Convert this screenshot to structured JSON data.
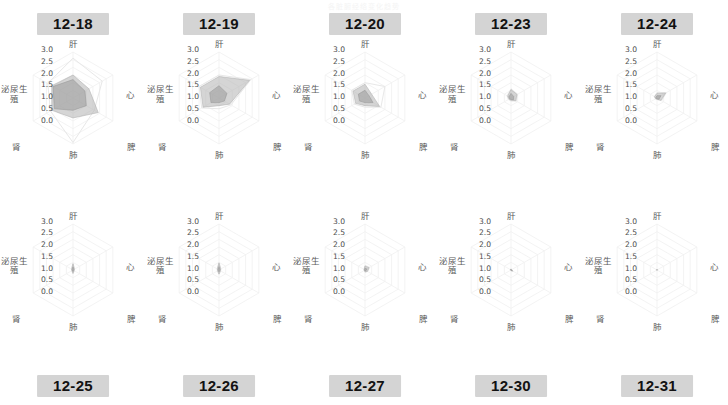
{
  "page": {
    "title": "各脏腑经络变化趋势"
  },
  "axes": {
    "labels": [
      "肝",
      "心",
      "脾",
      "肺",
      "肾",
      "泌尿生殖"
    ],
    "tick_labels": [
      "3.0",
      "2.5",
      "2.0",
      "1.5",
      "1.0",
      "0.5",
      "0.0"
    ],
    "radial_max": 3.0,
    "radial_min": 0.0
  },
  "colors": {
    "badge_bg": "#d4d4d4",
    "badge_text": "#121212",
    "grid_line": "#f0f0f0",
    "series_outline_fill": "none",
    "series_outline_stroke": "#e8e8e8",
    "series_fill_a": "#b3b3b3",
    "series_fill_b": "#9a9a9a",
    "axis_label_text": "#5a5a5a",
    "tick_text": "#4c4c4c",
    "page_bg": "#ffffff"
  },
  "chart_data": {
    "type": "radar",
    "title": "各脏腑经络变化趋势",
    "categories": [
      "肝",
      "心",
      "脾",
      "肺",
      "肾",
      "泌尿生殖"
    ],
    "rlim": [
      0.0,
      3.0
    ],
    "tick_values": [
      0.0,
      0.5,
      1.0,
      1.5,
      2.0,
      2.5,
      3.0
    ],
    "grid": true,
    "legend": "none",
    "panels": [
      {
        "label": "12-18",
        "row": "top",
        "series": [
          {
            "name": "外层",
            "values": [
              2.6,
              2.2,
              1.6,
              2.9,
              1.7,
              1.9
            ],
            "style": "outline"
          },
          {
            "name": "中层",
            "values": [
              1.5,
              1.2,
              1.9,
              1.3,
              1.6,
              1.6
            ],
            "style": "fill-a"
          },
          {
            "name": "内层",
            "values": [
              1.2,
              0.9,
              1.0,
              0.8,
              1.4,
              1.5
            ],
            "style": "fill-b"
          }
        ]
      },
      {
        "label": "12-19",
        "row": "top",
        "series": [
          {
            "name": "外层",
            "values": [
              1.5,
              2.4,
              0.9,
              0.7,
              1.3,
              1.5
            ],
            "style": "outline"
          },
          {
            "name": "中层",
            "values": [
              1.4,
              2.3,
              0.8,
              0.5,
              1.2,
              1.4
            ],
            "style": "fill-a"
          },
          {
            "name": "内层",
            "values": [
              0.8,
              0.6,
              0.4,
              0.3,
              0.6,
              0.7
            ],
            "style": "fill-b"
          }
        ]
      },
      {
        "label": "12-20",
        "row": "top",
        "series": [
          {
            "name": "外层",
            "values": [
              1.0,
              1.5,
              1.2,
              0.6,
              0.8,
              1.0
            ],
            "style": "outline"
          },
          {
            "name": "中层",
            "values": [
              0.9,
              0.5,
              1.1,
              0.5,
              0.7,
              0.9
            ],
            "style": "fill-a"
          },
          {
            "name": "内层",
            "values": [
              0.5,
              0.3,
              0.6,
              0.3,
              0.4,
              0.5
            ],
            "style": "fill-b"
          }
        ]
      },
      {
        "label": "12-23",
        "row": "top",
        "series": [
          {
            "name": "外层",
            "values": [
              0.6,
              0.5,
              0.4,
              0.2,
              0.2,
              0.3
            ],
            "style": "outline"
          },
          {
            "name": "中层",
            "values": [
              0.55,
              0.45,
              0.35,
              0.15,
              0.15,
              0.25
            ],
            "style": "fill-a"
          },
          {
            "name": "内层",
            "values": [
              0.3,
              0.2,
              0.2,
              0.1,
              0.1,
              0.15
            ],
            "style": "fill-b"
          }
        ]
      },
      {
        "label": "12-24",
        "row": "top",
        "series": [
          {
            "name": "外层",
            "values": [
              0.35,
              0.7,
              0.35,
              0.1,
              0.12,
              0.2
            ],
            "style": "outline"
          },
          {
            "name": "中层",
            "values": [
              0.3,
              0.65,
              0.3,
              0.08,
              0.1,
              0.18
            ],
            "style": "fill-a"
          },
          {
            "name": "内层",
            "values": [
              0.15,
              0.3,
              0.15,
              0.05,
              0.05,
              0.08
            ],
            "style": "fill-b"
          }
        ]
      },
      {
        "label": "12-25",
        "row": "bottom",
        "series": [
          {
            "name": "外层",
            "values": [
              0.45,
              0.12,
              0.1,
              0.25,
              0.1,
              0.12
            ],
            "style": "outline"
          },
          {
            "name": "中层",
            "values": [
              0.4,
              0.1,
              0.08,
              0.22,
              0.08,
              0.1
            ],
            "style": "fill-a"
          },
          {
            "name": "内层",
            "values": [
              0.2,
              0.05,
              0.04,
              0.1,
              0.04,
              0.05
            ],
            "style": "fill-b"
          }
        ]
      },
      {
        "label": "12-26",
        "row": "bottom",
        "series": [
          {
            "name": "外层",
            "values": [
              0.5,
              0.15,
              0.12,
              0.3,
              0.12,
              0.15
            ],
            "style": "outline"
          },
          {
            "name": "中层",
            "values": [
              0.45,
              0.12,
              0.1,
              0.26,
              0.1,
              0.12
            ],
            "style": "fill-a"
          },
          {
            "name": "内层",
            "values": [
              0.22,
              0.06,
              0.05,
              0.12,
              0.05,
              0.06
            ],
            "style": "fill-b"
          }
        ]
      },
      {
        "label": "12-27",
        "row": "bottom",
        "series": [
          {
            "name": "外层",
            "values": [
              0.3,
              0.35,
              0.2,
              0.15,
              0.06,
              0.08
            ],
            "style": "outline"
          },
          {
            "name": "中层",
            "values": [
              0.26,
              0.3,
              0.18,
              0.12,
              0.05,
              0.06
            ],
            "style": "fill-a"
          },
          {
            "name": "内层",
            "values": [
              0.12,
              0.14,
              0.08,
              0.06,
              0.03,
              0.03
            ],
            "style": "fill-b"
          }
        ]
      },
      {
        "label": "12-30",
        "row": "bottom",
        "series": [
          {
            "name": "外层",
            "values": [
              0.08,
              0.05,
              0.16,
              0.05,
              0.04,
              0.05
            ],
            "style": "outline"
          },
          {
            "name": "中层",
            "values": [
              0.07,
              0.04,
              0.14,
              0.04,
              0.03,
              0.04
            ],
            "style": "fill-a"
          },
          {
            "name": "内层",
            "values": [
              0.03,
              0.02,
              0.07,
              0.02,
              0.015,
              0.02
            ],
            "style": "fill-b"
          }
        ]
      },
      {
        "label": "12-31",
        "row": "bottom",
        "series": [
          {
            "name": "外层",
            "values": [
              0.04,
              0.03,
              0.03,
              0.03,
              0.03,
              0.03
            ],
            "style": "outline"
          },
          {
            "name": "中层",
            "values": [
              0.03,
              0.02,
              0.02,
              0.02,
              0.02,
              0.02
            ],
            "style": "fill-a"
          },
          {
            "name": "内层",
            "values": [
              0.015,
              0.01,
              0.01,
              0.01,
              0.01,
              0.01
            ],
            "style": "fill-b"
          }
        ]
      }
    ]
  }
}
